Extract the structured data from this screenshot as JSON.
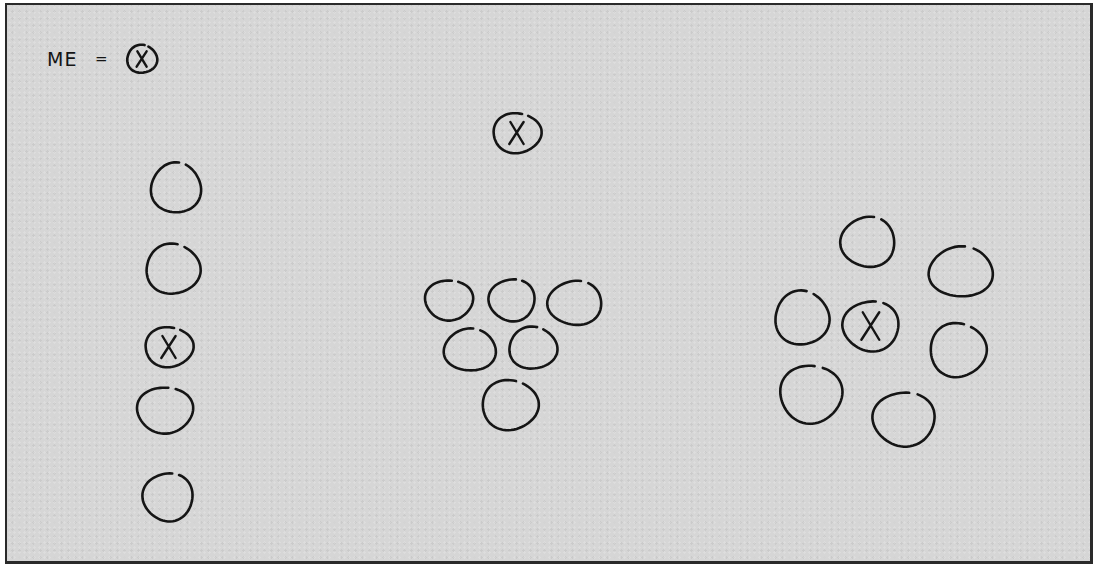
{
  "diagram": {
    "title": "",
    "legend": {
      "label": "ME",
      "equals": "=",
      "symbol": "circle-with-x",
      "symbol_text": "X"
    },
    "colors": {
      "background": "#d6d6d6",
      "ink": "#151515",
      "border": "#2a2a2a"
    },
    "groups": [
      {
        "name": "line-formation",
        "description": "Vertical column of five people; me in the middle",
        "members": [
          {
            "cx": 176,
            "cy": 188,
            "rx": 25,
            "ry": 25,
            "is_me": false
          },
          {
            "cx": 173,
            "cy": 269,
            "rx": 27,
            "ry": 25,
            "is_me": false
          },
          {
            "cx": 169,
            "cy": 347,
            "rx": 24,
            "ry": 20,
            "is_me": true,
            "mark": "X"
          },
          {
            "cx": 165,
            "cy": 410,
            "rx": 28,
            "ry": 23,
            "is_me": false
          },
          {
            "cx": 168,
            "cy": 497,
            "rx": 25,
            "ry": 24,
            "is_me": false
          }
        ]
      },
      {
        "name": "apart-from-group",
        "description": "Me standing apart above a cluster of six",
        "members": [
          {
            "cx": 517,
            "cy": 133,
            "rx": 24,
            "ry": 20,
            "is_me": true,
            "mark": "X"
          },
          {
            "cx": 449,
            "cy": 300,
            "rx": 24,
            "ry": 20,
            "is_me": false
          },
          {
            "cx": 512,
            "cy": 300,
            "rx": 23,
            "ry": 21,
            "is_me": false
          },
          {
            "cx": 575,
            "cy": 303,
            "rx": 27,
            "ry": 22,
            "is_me": false
          },
          {
            "cx": 470,
            "cy": 350,
            "rx": 26,
            "ry": 21,
            "is_me": false
          },
          {
            "cx": 533,
            "cy": 348,
            "rx": 24,
            "ry": 21,
            "is_me": false
          },
          {
            "cx": 510,
            "cy": 405,
            "rx": 28,
            "ry": 25,
            "is_me": false
          }
        ]
      },
      {
        "name": "center-of-circle",
        "description": "Me in the center surrounded by six people",
        "members": [
          {
            "cx": 871,
            "cy": 326,
            "rx": 28,
            "ry": 25,
            "is_me": true,
            "mark": "X"
          },
          {
            "cx": 868,
            "cy": 242,
            "rx": 27,
            "ry": 25,
            "is_me": false
          },
          {
            "cx": 961,
            "cy": 272,
            "rx": 32,
            "ry": 25,
            "is_me": false
          },
          {
            "cx": 802,
            "cy": 318,
            "rx": 27,
            "ry": 27,
            "is_me": false
          },
          {
            "cx": 958,
            "cy": 350,
            "rx": 28,
            "ry": 27,
            "is_me": false
          },
          {
            "cx": 811,
            "cy": 394,
            "rx": 31,
            "ry": 29,
            "is_me": false
          },
          {
            "cx": 904,
            "cy": 419,
            "rx": 31,
            "ry": 27,
            "is_me": false
          }
        ]
      }
    ],
    "legend_symbol": {
      "cx": 142,
      "cy": 59,
      "rx": 15,
      "ry": 14
    }
  }
}
